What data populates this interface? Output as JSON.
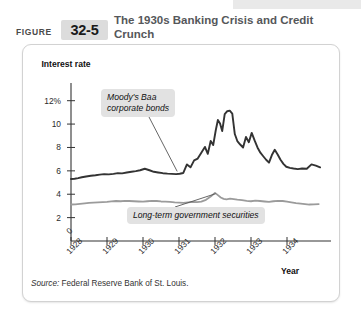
{
  "figure": {
    "label": "FIGURE",
    "number": "32-5",
    "title": "The 1930s Banking Crisis and Credit Crunch"
  },
  "source": {
    "prefix": "Source:",
    "text": " Federal Reserve Bank of St. Louis."
  },
  "annotations": {
    "baa": "Moody's Baa\ncorporate bonds",
    "gov": "Long-term government securities"
  },
  "colors": {
    "baa_line": "#333333",
    "gov_line": "#9b9b9b",
    "axis": "#333333",
    "callout_bg": "#e2e2e2",
    "badge_bg": "#dcdcdc",
    "title_text": "#55575a"
  },
  "chart_data": {
    "type": "line",
    "title": "The 1930s Banking Crisis and Credit Crunch",
    "xlabel": "Year",
    "ylabel": "Interest rate",
    "ylim": [
      0,
      13
    ],
    "xlim": [
      1928,
      1935
    ],
    "grid": false,
    "legend": "annotations",
    "ytick_labels": [
      "12%",
      "10",
      "8",
      "6",
      "4",
      "2",
      "0"
    ],
    "ytick_values": [
      12,
      10,
      8,
      6,
      4,
      2,
      0
    ],
    "xtick_labels": [
      "1928",
      "1929",
      "1930",
      "1931",
      "1932",
      "1933",
      "1934"
    ],
    "xtick_values": [
      1928,
      1929,
      1930,
      1931,
      1932,
      1933,
      1934
    ],
    "series": [
      {
        "name": "Moody's Baa corporate bonds",
        "color": "#333333",
        "x": [
          1928.0,
          1928.1,
          1928.2,
          1928.3,
          1928.42,
          1928.55,
          1928.68,
          1928.8,
          1928.92,
          1929.05,
          1929.18,
          1929.3,
          1929.42,
          1929.55,
          1929.68,
          1929.8,
          1929.92,
          1930.05,
          1930.18,
          1930.3,
          1930.42,
          1930.55,
          1930.68,
          1930.8,
          1930.92,
          1931.02,
          1931.12,
          1931.22,
          1931.32,
          1931.42,
          1931.52,
          1931.62,
          1931.72,
          1931.8,
          1931.88,
          1931.95,
          1932.02,
          1932.08,
          1932.14,
          1932.2,
          1932.27,
          1932.34,
          1932.41,
          1932.48,
          1932.55,
          1932.62,
          1932.7,
          1932.78,
          1932.86,
          1932.94,
          1933.02,
          1933.1,
          1933.18,
          1933.26,
          1933.34,
          1933.42,
          1933.5,
          1933.58,
          1933.66,
          1933.74,
          1933.82,
          1933.9,
          1933.98,
          1934.08,
          1934.18,
          1934.3,
          1934.42,
          1934.55,
          1934.68,
          1934.8,
          1934.92
        ],
        "y": [
          5.3,
          5.32,
          5.38,
          5.45,
          5.52,
          5.58,
          5.62,
          5.68,
          5.72,
          5.7,
          5.74,
          5.8,
          5.78,
          5.86,
          5.92,
          5.98,
          6.05,
          6.18,
          6.05,
          5.92,
          5.86,
          5.8,
          5.76,
          5.74,
          5.72,
          5.75,
          5.82,
          6.55,
          6.3,
          6.9,
          7.05,
          7.55,
          8.05,
          7.45,
          8.55,
          8.2,
          9.45,
          10.35,
          10.05,
          9.4,
          10.85,
          11.1,
          11.15,
          10.9,
          9.15,
          8.55,
          8.25,
          8.0,
          8.9,
          8.45,
          9.25,
          8.6,
          8.0,
          7.55,
          7.25,
          6.95,
          6.7,
          7.35,
          7.8,
          7.4,
          6.95,
          6.6,
          6.35,
          6.25,
          6.2,
          6.15,
          6.2,
          6.18,
          6.55,
          6.45,
          6.3
        ]
      },
      {
        "name": "Long-term government securities",
        "color": "#9b9b9b",
        "x": [
          1928.0,
          1928.12,
          1928.25,
          1928.38,
          1928.5,
          1928.62,
          1928.75,
          1928.88,
          1929.0,
          1929.12,
          1929.25,
          1929.38,
          1929.5,
          1929.62,
          1929.75,
          1929.88,
          1930.0,
          1930.12,
          1930.25,
          1930.38,
          1930.5,
          1930.62,
          1930.75,
          1930.88,
          1931.0,
          1931.12,
          1931.25,
          1931.38,
          1931.5,
          1931.62,
          1931.75,
          1931.88,
          1932.0,
          1932.08,
          1932.16,
          1932.24,
          1932.32,
          1932.42,
          1932.52,
          1932.62,
          1932.75,
          1932.88,
          1933.0,
          1933.12,
          1933.25,
          1933.38,
          1933.5,
          1933.62,
          1933.75,
          1933.88,
          1934.0,
          1934.12,
          1934.25,
          1934.38,
          1934.5,
          1934.62,
          1934.75,
          1934.88
        ],
        "y": [
          3.12,
          3.14,
          3.18,
          3.22,
          3.26,
          3.28,
          3.3,
          3.32,
          3.34,
          3.38,
          3.42,
          3.4,
          3.44,
          3.42,
          3.4,
          3.38,
          3.36,
          3.4,
          3.44,
          3.42,
          3.38,
          3.36,
          3.34,
          3.3,
          3.28,
          3.26,
          3.3,
          3.34,
          3.32,
          3.36,
          3.52,
          3.8,
          4.12,
          3.92,
          3.72,
          3.6,
          3.56,
          3.62,
          3.58,
          3.54,
          3.5,
          3.44,
          3.4,
          3.46,
          3.42,
          3.38,
          3.34,
          3.4,
          3.44,
          3.42,
          3.36,
          3.3,
          3.24,
          3.2,
          3.16,
          3.12,
          3.14,
          3.16
        ]
      }
    ]
  }
}
